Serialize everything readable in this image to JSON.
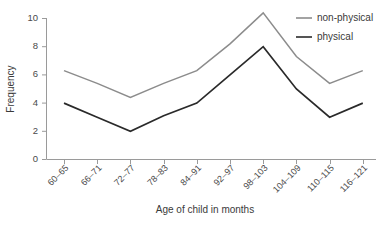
{
  "chart_data": {
    "type": "line",
    "title": "",
    "xlabel": "Age of child in months",
    "ylabel": "Frequency",
    "categories": [
      "60–65",
      "66–71",
      "72–77",
      "78–83",
      "84–91",
      "92–97",
      "98–103",
      "104–109",
      "110–115",
      "116–121"
    ],
    "series": [
      {
        "name": "non-physical",
        "color": "#8c8c8c",
        "values": [
          6.3,
          5.4,
          4.4,
          5.4,
          6.3,
          8.2,
          10.4,
          7.3,
          5.4,
          6.3
        ]
      },
      {
        "name": "physical",
        "color": "#2a2a2a",
        "values": [
          4.0,
          3.0,
          2.0,
          3.1,
          4.0,
          6.0,
          8.0,
          5.0,
          3.0,
          4.0
        ]
      }
    ],
    "ylim": [
      0,
      10
    ],
    "yticks": [
      0,
      2,
      4,
      6,
      8,
      10
    ],
    "ytick_labels": [
      "0",
      "2",
      "4",
      "6",
      "8",
      "10"
    ],
    "grid": false,
    "legend_position": "top-right"
  },
  "legend": {
    "items": [
      {
        "label": "non-physical",
        "color": "#8c8c8c"
      },
      {
        "label": "physical",
        "color": "#2a2a2a"
      }
    ]
  },
  "axes": {
    "y_label": "Frequency",
    "x_label": "Age of child in months"
  },
  "caption": {
    "text": ""
  }
}
